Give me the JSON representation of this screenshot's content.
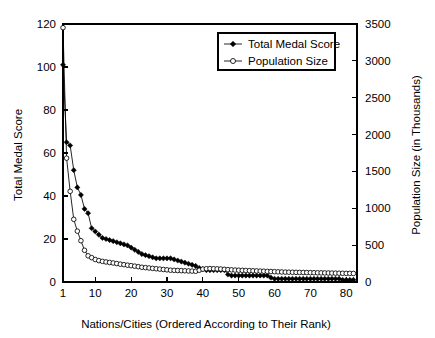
{
  "chart_data": {
    "type": "line",
    "title": "",
    "xlabel": "Nations/Cities (Ordered According to Their Rank)",
    "ylabel": "Total Medal Score",
    "y2label": "Population Size (in Thousands)",
    "xlim": [
      1,
      83
    ],
    "ylim": [
      0,
      120
    ],
    "y2lim": [
      0,
      3500
    ],
    "grid": false,
    "legend_position": "top-right",
    "xticks": [
      1,
      10,
      20,
      30,
      40,
      50,
      60,
      70,
      80
    ],
    "xtick_labels": [
      "1",
      "10",
      "20",
      "30",
      "40",
      "50",
      "60",
      "70",
      "80"
    ],
    "yticks": [
      0,
      20,
      40,
      60,
      80,
      100,
      120
    ],
    "ytick_labels": [
      "0",
      "20",
      "40",
      "60",
      "80",
      "100",
      "120"
    ],
    "y2ticks": [
      0,
      500,
      1000,
      1500,
      2000,
      2500,
      3000,
      3500
    ],
    "y2tick_labels": [
      "0",
      "500",
      "1000",
      "1500",
      "2000",
      "2500",
      "3000",
      "3500"
    ],
    "x": [
      1,
      2,
      3,
      4,
      5,
      6,
      7,
      8,
      9,
      10,
      11,
      12,
      13,
      14,
      15,
      16,
      17,
      18,
      19,
      20,
      21,
      22,
      23,
      24,
      25,
      26,
      27,
      28,
      29,
      30,
      31,
      32,
      33,
      34,
      35,
      36,
      37,
      38,
      39,
      40,
      41,
      42,
      43,
      44,
      45,
      46,
      47,
      48,
      49,
      50,
      51,
      52,
      53,
      54,
      55,
      56,
      57,
      58,
      59,
      60,
      61,
      62,
      63,
      64,
      65,
      66,
      67,
      68,
      69,
      70,
      71,
      72,
      73,
      74,
      75,
      76,
      77,
      78,
      79,
      80,
      81,
      82
    ],
    "series": [
      {
        "name": "Total Medal Score",
        "marker": "filled-diamond",
        "axis": "left",
        "values": [
          101,
          65,
          63.5,
          52,
          44,
          40.5,
          34,
          32,
          25,
          23.5,
          22,
          20.5,
          20,
          19.5,
          19,
          18.5,
          18,
          17.5,
          17,
          16,
          15,
          14,
          13,
          12.5,
          12,
          11.5,
          11,
          11,
          11,
          11,
          11,
          10.5,
          10,
          9.5,
          9,
          8.5,
          8,
          7.5,
          6.5,
          6,
          5.5,
          5.5,
          5.5,
          5.5,
          5.5,
          5.5,
          3.5,
          3,
          3,
          3,
          3,
          3,
          3,
          3,
          3,
          3,
          3,
          3,
          2,
          1.5,
          1.5,
          1.5,
          1.5,
          1.5,
          1.5,
          1.5,
          1.5,
          1.5,
          1.5,
          1.5,
          1.5,
          1.5,
          1.5,
          1.5,
          1.5,
          1.5,
          1.5,
          1.5,
          1,
          1,
          1,
          1
        ]
      },
      {
        "name": "Population Size",
        "marker": "open-circle",
        "axis": "right",
        "values": [
          3450,
          1680,
          1230,
          850,
          690,
          560,
          430,
          355,
          330,
          305,
          290,
          280,
          272,
          265,
          258,
          250,
          242,
          235,
          228,
          222,
          215,
          208,
          200,
          195,
          190,
          185,
          180,
          175,
          170,
          165,
          160,
          158,
          156,
          154,
          152,
          150,
          148,
          146,
          160,
          175,
          180,
          182,
          180,
          178,
          176,
          172,
          168,
          165,
          162,
          160,
          158,
          156,
          154,
          152,
          150,
          148,
          146,
          144,
          142,
          140,
          138,
          136,
          134,
          133,
          132,
          131,
          130,
          129,
          128,
          127,
          126,
          125,
          124,
          123,
          122,
          121,
          120,
          119,
          118,
          117,
          117,
          116
        ]
      }
    ]
  },
  "legend": {
    "items": [
      {
        "label": "Total Medal Score",
        "marker": "filled-diamond"
      },
      {
        "label": "Population Size",
        "marker": "open-circle"
      }
    ]
  }
}
